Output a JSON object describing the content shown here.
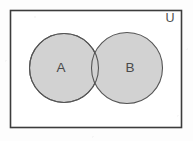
{
  "figure": {
    "kind": "venn-diagram",
    "universe_label": "U",
    "sets": [
      {
        "id": "A",
        "label": "A"
      },
      {
        "id": "B",
        "label": "B"
      }
    ],
    "geometry": {
      "canvas": {
        "width": 193,
        "height": 141
      },
      "universe_rect": {
        "x": 10.5,
        "y": 10.5,
        "width": 171,
        "height": 117
      },
      "circle_a": {
        "cx": 64,
        "cy": 68,
        "r": 34.5
      },
      "circle_b": {
        "cx": 127,
        "cy": 68,
        "r": 35.5
      },
      "label_a": {
        "x": 61,
        "y": 67
      },
      "label_b": {
        "x": 130,
        "y": 67
      },
      "label_u": {
        "x": 170,
        "y": 19
      }
    },
    "colors": {
      "page_background": "#fdfdfd",
      "universe_fill": "#ffffff",
      "universe_stroke": "#3c3c3c",
      "circle_fill": "#d2d2d2",
      "circle_stroke": "#555555",
      "label_color": "#4a4a4a"
    },
    "strokes": {
      "universe_width": 1.6,
      "circle_width": 1.1
    }
  }
}
